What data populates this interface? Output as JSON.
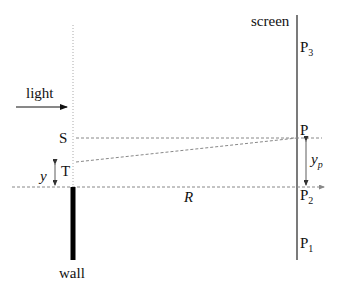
{
  "diagram": {
    "type": "single-slit / wall diffraction geometry",
    "labels": {
      "screen": "screen",
      "light": "light",
      "S": "S",
      "T": "T",
      "y": "y",
      "R": "R",
      "wall": "wall",
      "P": "P",
      "P3": "P",
      "P3_sub": "3",
      "P2": "P",
      "P2_sub": "2",
      "P1": "P",
      "P1_sub": "1",
      "yp": "y",
      "yp_sub": "p"
    },
    "colors": {
      "line": "#111111",
      "dashed": "#888888",
      "dotted": "#aaaaaa"
    }
  }
}
